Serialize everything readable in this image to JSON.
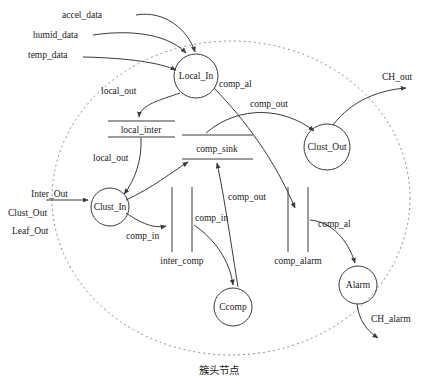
{
  "diagram": {
    "type": "data-flow-diagram",
    "caption": "簇头节点",
    "boundary": {
      "name": "cluster-head-node-boundary",
      "style": "dashed-ellipse"
    },
    "processes": [
      {
        "id": "local_in",
        "label": "Local_In",
        "cx": 196,
        "cy": 76,
        "r": 22
      },
      {
        "id": "clust_out",
        "label": "Clust_Out",
        "cx": 327,
        "cy": 147,
        "r": 23
      },
      {
        "id": "clust_in",
        "label": "Clust_In",
        "cx": 110,
        "cy": 207,
        "r": 19
      },
      {
        "id": "ccomp",
        "label": "Ccomp",
        "cx": 233,
        "cy": 307,
        "r": 19
      },
      {
        "id": "alarm",
        "label": "Alarm",
        "cx": 358,
        "cy": 285,
        "r": 19
      }
    ],
    "data_stores": [
      {
        "id": "local_inter",
        "label": "local_inter",
        "orientation": "horizontal"
      },
      {
        "id": "comp_sink",
        "label": "comp_sink",
        "orientation": "horizontal"
      },
      {
        "id": "inter_comp",
        "label": "inter_comp",
        "orientation": "vertical"
      },
      {
        "id": "comp_alarm",
        "label": "comp_alarm",
        "orientation": "vertical"
      }
    ],
    "external_inputs": [
      {
        "id": "accel_data",
        "label": "accel_data"
      },
      {
        "id": "humid_data",
        "label": "humid_data"
      },
      {
        "id": "temp_data",
        "label": "temp_data"
      },
      {
        "id": "inter_out",
        "label": "Inter_Out"
      },
      {
        "id": "clust_out_in",
        "label": "Clust_Out"
      },
      {
        "id": "leaf_out",
        "label": "Leaf_Out"
      }
    ],
    "external_outputs": [
      {
        "id": "ch_out",
        "label": "CH_out"
      },
      {
        "id": "ch_alarm",
        "label": "CH_alarm"
      }
    ],
    "flow_labels": [
      {
        "id": "local_out_1",
        "label": "local_out"
      },
      {
        "id": "local_out_2",
        "label": "local_out"
      },
      {
        "id": "comp_al_1",
        "label": "comp_al"
      },
      {
        "id": "comp_al_2",
        "label": "comp_al"
      },
      {
        "id": "comp_out_1",
        "label": "comp_out"
      },
      {
        "id": "comp_out_2",
        "label": "comp_out"
      },
      {
        "id": "comp_in_1",
        "label": "comp_in"
      },
      {
        "id": "comp_in_2",
        "label": "comp_in"
      }
    ],
    "colors": {
      "stroke": "#3a3a3a",
      "boundary": "#8a8a8a",
      "background": "#ffffff",
      "text": "#1a1a1a"
    }
  }
}
